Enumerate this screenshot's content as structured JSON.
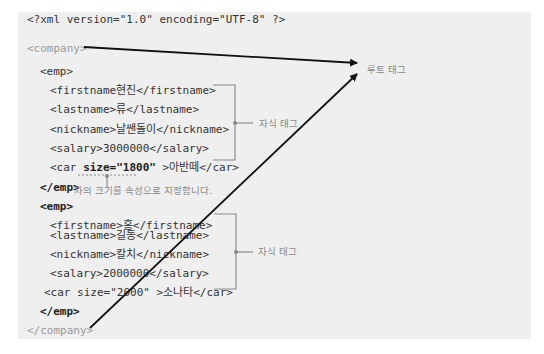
{
  "code_lines": [
    {
      "text": "<?xml version=\"1.0\" encoding=\"UTF-8\" ?>",
      "indent": 0,
      "style": "normal"
    },
    {
      "text": "<company>",
      "indent": 0,
      "style": "light"
    },
    {
      "text": "<emp>",
      "indent": 1,
      "style": "normal"
    },
    {
      "text": "<firstname현진</firstname>",
      "indent": 2,
      "style": "normal"
    },
    {
      "text": "<lastname>류</lastname>",
      "indent": 2,
      "style": "normal"
    },
    {
      "text": "<nickname>날쌘돌이</nickname>",
      "indent": 2,
      "style": "normal"
    },
    {
      "text": "<salary>3000000</salary>",
      "indent": 2,
      "style": "normal"
    },
    {
      "pre": "<car ",
      "attr": "size=\"1800\"",
      "post": " >아반떼</car>",
      "indent": 2,
      "style": "normal"
    },
    {
      "text": "</emp>",
      "indent": 1,
      "style": "bold"
    },
    {
      "text": "<emp>",
      "indent": 1,
      "style": "bold"
    },
    {
      "text": "<firstname>홍</firstname>",
      "indent": 2,
      "style": "normal"
    },
    {
      "text": "<lastname>길동</lastname>",
      "indent": 2,
      "style": "normal"
    },
    {
      "text": "<nickname>칼치</nickname>",
      "indent": 2,
      "style": "normal"
    },
    {
      "text": "<salary>2000000</salary>",
      "indent": 2,
      "style": "normal"
    },
    {
      "text": "<car size=\"2000\" >소나타</car>",
      "indent": 1.6,
      "style": "normal"
    },
    {
      "text": "</emp>",
      "indent": 1,
      "style": "bold"
    },
    {
      "text": "</company>",
      "indent": 0,
      "style": "light"
    }
  ],
  "annotations": {
    "root_tag": "루트 태그",
    "child_tag_1": "자식 태그",
    "child_tag_2": "자식 태그",
    "attribute_note": "차의 크기를 속성으로 지정합니다."
  },
  "colors": {
    "panel_bg": "#efefef",
    "arrow": "#111111",
    "bracket": "#8a8a8a",
    "label": "#8a8a8a"
  }
}
